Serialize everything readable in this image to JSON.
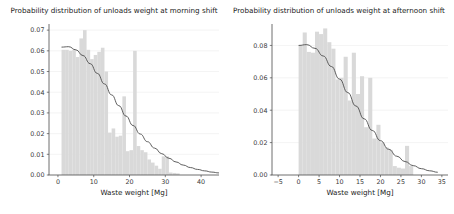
{
  "figure": {
    "width": 454,
    "height": 214,
    "background": "#ffffff",
    "bar_color": "#d9d9d9",
    "curve_color": "#4d4d4d"
  },
  "chart_data": [
    {
      "type": "bar",
      "id": "morning-shift",
      "title": "Probability distribution of unloads weight at morning shift",
      "xlabel": "Waste weight [Mg]",
      "ylabel": "",
      "grid": true,
      "legend": "none",
      "xlim": [
        -2.5,
        45.0
      ],
      "ylim": [
        0.0,
        0.072
      ],
      "xticks": [
        0,
        10,
        20,
        30,
        40
      ],
      "xtick_labels": [
        "0",
        "10",
        "20",
        "30",
        "40"
      ],
      "yticks": [
        0.0,
        0.01,
        0.02,
        0.03,
        0.04,
        0.05,
        0.06,
        0.07
      ],
      "ytick_labels": [
        "0.00",
        "0.01",
        "0.02",
        "0.03",
        "0.04",
        "0.05",
        "0.06",
        "0.07"
      ],
      "bin_width": 1.0,
      "bin_starts": [
        1.0,
        2.0,
        3.0,
        4.0,
        5.0,
        6.0,
        7.0,
        8.0,
        9.0,
        10.0,
        11.0,
        12.0,
        13.0,
        14.0,
        15.0,
        16.0,
        17.0,
        18.0,
        19.0,
        20.0,
        21.0,
        22.0,
        23.0,
        24.0,
        25.0,
        26.0,
        27.0,
        28.0,
        29.0,
        30.0,
        31.0,
        32.0,
        33.0
      ],
      "values": [
        0.0605,
        0.0605,
        0.06,
        0.0606,
        0.057,
        0.066,
        0.07,
        0.0605,
        0.056,
        0.058,
        0.0595,
        0.0615,
        0.05,
        0.0205,
        0.0225,
        0.0185,
        0.019,
        0.038,
        0.0115,
        0.012,
        0.06,
        0.014,
        0.012,
        0.011,
        0.0075,
        0.006,
        0.0045,
        0.003,
        0.009,
        0.009,
        0.0012,
        0.001,
        0.0008
      ],
      "curve": {
        "name": "fitted pdf",
        "x": [
          1.0,
          3.0,
          5.0,
          7.0,
          9.0,
          11.0,
          13.0,
          15.0,
          17.0,
          19.0,
          21.0,
          23.0,
          25.0,
          27.0,
          29.0,
          31.0,
          33.0,
          35.0,
          37.0,
          39.0,
          41.0,
          43.0,
          45.0
        ],
        "y": [
          0.0618,
          0.062,
          0.0605,
          0.0577,
          0.0538,
          0.0491,
          0.044,
          0.0387,
          0.0335,
          0.0285,
          0.0239,
          0.0198,
          0.0161,
          0.013,
          0.0103,
          0.0081,
          0.0063,
          0.0048,
          0.0036,
          0.0027,
          0.002,
          0.0014,
          0.001
        ]
      }
    },
    {
      "type": "bar",
      "id": "afternoon-shift",
      "title": "Probability distribution of unloads weight at afternoon shift",
      "xlabel": "Waste weight [Mg]",
      "ylabel": "",
      "grid": true,
      "legend": "none",
      "xlim": [
        -6.5,
        36.5
      ],
      "ylim": [
        0.0,
        0.092
      ],
      "xticks": [
        -5,
        0,
        5,
        10,
        15,
        20,
        25,
        30,
        35
      ],
      "xtick_labels": [
        "−5",
        "0",
        "5",
        "10",
        "15",
        "20",
        "25",
        "30",
        "35"
      ],
      "yticks": [
        0.0,
        0.02,
        0.04,
        0.06,
        0.08
      ],
      "ytick_labels": [
        "0.00",
        "0.02",
        "0.04",
        "0.06",
        "0.08"
      ],
      "bin_width": 1.0,
      "bin_starts": [
        0.0,
        1.0,
        2.0,
        3.0,
        4.0,
        5.0,
        6.0,
        7.0,
        8.0,
        9.0,
        10.0,
        11.0,
        12.0,
        13.0,
        14.0,
        15.0,
        16.0,
        17.0,
        18.0,
        19.0,
        20.0,
        21.0,
        22.0,
        23.0,
        24.0,
        25.0,
        26.0,
        27.0
      ],
      "values": [
        0.08,
        0.088,
        0.076,
        0.0755,
        0.0885,
        0.087,
        0.0905,
        0.082,
        0.078,
        0.059,
        0.06,
        0.073,
        0.046,
        0.0755,
        0.05,
        0.061,
        0.0295,
        0.06,
        0.0225,
        0.031,
        0.02,
        0.017,
        0.0155,
        0.0055,
        0.0045,
        0.004,
        0.018,
        0.0055
      ],
      "curve": {
        "name": "fitted pdf",
        "x": [
          0.0,
          2.0,
          4.0,
          6.0,
          8.0,
          10.0,
          12.0,
          14.0,
          16.0,
          18.0,
          20.0,
          22.0,
          24.0,
          26.0,
          28.0,
          30.0,
          32.0,
          34.0
        ],
        "y": [
          0.08,
          0.0805,
          0.0782,
          0.0735,
          0.067,
          0.0592,
          0.0509,
          0.0426,
          0.0347,
          0.0275,
          0.0212,
          0.0159,
          0.0116,
          0.0083,
          0.0058,
          0.0039,
          0.0026,
          0.0017
        ]
      }
    }
  ]
}
